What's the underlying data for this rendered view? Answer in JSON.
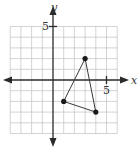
{
  "figure": {
    "x_axis_label": "x",
    "y_axis_label": "y",
    "x_tick_label": "5",
    "y_tick_label": "5",
    "grid": {
      "x_min": -4,
      "x_max": 6,
      "y_min": -5,
      "y_max": 5,
      "step": 1
    },
    "colors": {
      "grid": "#c8c8c8",
      "axis": "#2a2a2a",
      "edge": "#3a3a3a",
      "vertex": "#1a1a1a"
    }
  },
  "chart_data": {
    "type": "scatter",
    "title": "",
    "xlabel": "x",
    "ylabel": "y",
    "xlim": [
      -4,
      6
    ],
    "ylim": [
      -5,
      5
    ],
    "grid": true,
    "tick_labels": {
      "x": [
        "5"
      ],
      "y": [
        "5"
      ]
    },
    "series": [
      {
        "name": "triangle",
        "closed": true,
        "points": [
          {
            "x": 3,
            "y": 2
          },
          {
            "x": 4,
            "y": -3
          },
          {
            "x": 1,
            "y": -2
          }
        ]
      }
    ]
  }
}
